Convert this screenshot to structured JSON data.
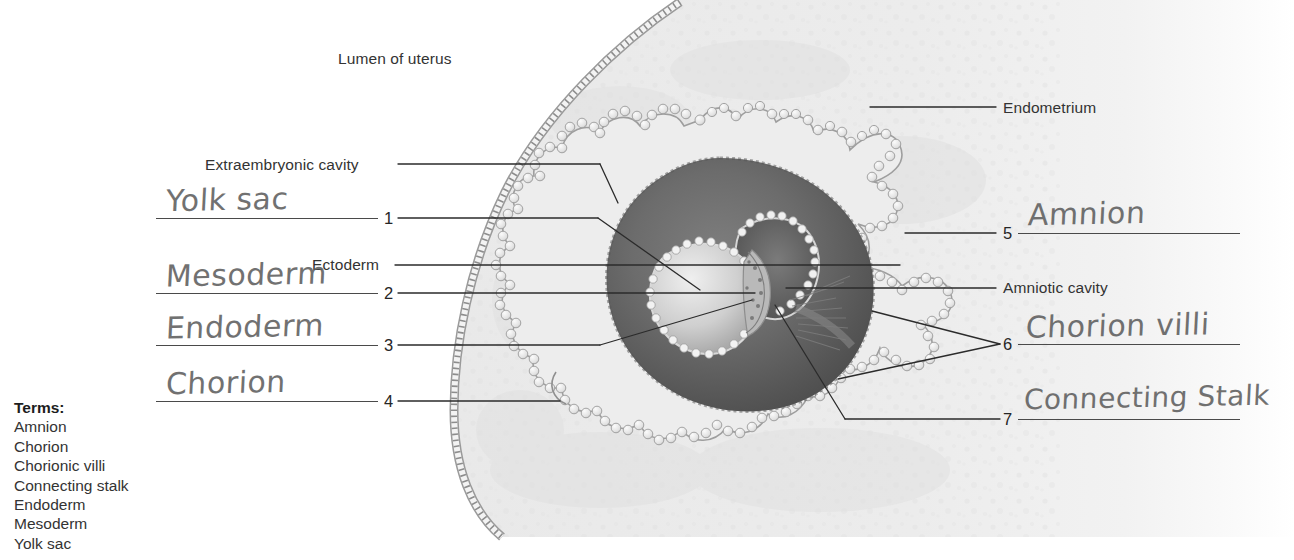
{
  "figure": {
    "printed_labels": [
      {
        "id": "lumen-of-uterus",
        "text": "Lumen of uterus",
        "x": 338,
        "y": 50,
        "align": "left"
      },
      {
        "id": "endometrium",
        "text": "Endometrium",
        "x": 1003,
        "y": 101,
        "align": "left"
      },
      {
        "id": "extraembryonic-cavity",
        "text": "Extraembryonic cavity",
        "x": 205,
        "y": 158,
        "align": "left"
      },
      {
        "id": "ectoderm",
        "text": "Ectoderm",
        "x": 310,
        "y": 258,
        "align": "left"
      },
      {
        "id": "amniotic-cavity",
        "text": "Amniotic cavity",
        "x": 1003,
        "y": 281,
        "align": "left"
      }
    ],
    "answer_slots": [
      {
        "number": "1",
        "answer": "Yolk sac",
        "side": "left"
      },
      {
        "number": "2",
        "answer": "Mesoderm",
        "side": "left"
      },
      {
        "number": "3",
        "answer": "Endoderm",
        "side": "left"
      },
      {
        "number": "4",
        "answer": "Chorion",
        "side": "left"
      },
      {
        "number": "5",
        "answer": "Amnion",
        "side": "right"
      },
      {
        "number": "6",
        "answer": "Chorion villi",
        "side": "right"
      },
      {
        "number": "7",
        "answer": "Connecting Stalk",
        "side": "right"
      }
    ],
    "terms": {
      "title": "Terms:",
      "items": [
        "Amnion",
        "Chorion",
        "Chorionic villi",
        "Connecting stalk",
        "Endoderm",
        "Mesoderm",
        "Yolk sac"
      ]
    },
    "colors": {
      "endometrium_stroma": "#ececec",
      "endometrium_edge": "#d8d8d8",
      "chorionic_cavity_dark": "#6f6f6f",
      "chorionic_cavity_darkest": "#4f4f4f",
      "villi_outline": "#8a8a8a",
      "leader_line": "#2b2b2b",
      "answer_rule": "#4a4a4a",
      "handwriting_ink": "#5e5e5e",
      "printed_text": "#333333",
      "page_background": "#ffffff"
    }
  }
}
